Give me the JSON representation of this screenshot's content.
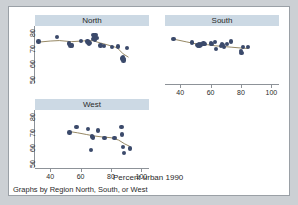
{
  "figure": {
    "x_axis_caption": "Percent urban 1990",
    "note": "Graphs by Region North, South, or West",
    "background": "#ffffff",
    "page_background": "#ccd0d4",
    "border_color": "#9aa0a6"
  },
  "style": {
    "marker_color": "#3b4a6b",
    "trend_color": "#8a7a52",
    "title_bar_color": "#ccd9e4",
    "axis_color": "#8d9298"
  },
  "chart_data": {
    "type": "scatter",
    "title": "",
    "xlabel": "Percent urban 1990",
    "ylabel": "",
    "xlim": [
      30,
      105
    ],
    "ylim": [
      47,
      83
    ],
    "xticks": [
      40,
      60,
      80,
      100
    ],
    "yticks": [
      50,
      60,
      70,
      80
    ],
    "grid": false,
    "legend": "none",
    "note": "Graphs by Region North, South, or West",
    "panels": [
      {
        "name": "North",
        "label": "North",
        "x_axis_shown": false,
        "y_axis_shown": true,
        "xticks": [
          40,
          60,
          80,
          100
        ],
        "yticks": [
          50,
          60,
          70,
          80
        ],
        "points": [
          {
            "x": 32.2,
            "y": 73.1
          },
          {
            "x": 44.6,
            "y": 76.0
          },
          {
            "x": 52.2,
            "y": 71.9
          },
          {
            "x": 53.3,
            "y": 70.6
          },
          {
            "x": 54.3,
            "y": 70.8
          },
          {
            "x": 60.3,
            "y": 73.5
          },
          {
            "x": 64.6,
            "y": 73.2
          },
          {
            "x": 65.2,
            "y": 72.6
          },
          {
            "x": 65.6,
            "y": 71.6
          },
          {
            "x": 66.3,
            "y": 72.4
          },
          {
            "x": 68.0,
            "y": 74.9
          },
          {
            "x": 68.4,
            "y": 77.2
          },
          {
            "x": 68.8,
            "y": 76.0
          },
          {
            "x": 69.3,
            "y": 74.2
          },
          {
            "x": 69.8,
            "y": 77.4
          },
          {
            "x": 70.4,
            "y": 75.6
          },
          {
            "x": 73.0,
            "y": 70.7
          },
          {
            "x": 75.5,
            "y": 70.4
          },
          {
            "x": 80.8,
            "y": 69.9
          },
          {
            "x": 84.5,
            "y": 70.0
          },
          {
            "x": 87.4,
            "y": 62.6
          },
          {
            "x": 87.8,
            "y": 63.6
          },
          {
            "x": 88.2,
            "y": 61.2
          },
          {
            "x": 88.6,
            "y": 62.3
          },
          {
            "x": 90.6,
            "y": 69.2
          }
        ],
        "trend": [
          {
            "x": 32.2,
            "y": 72.8
          },
          {
            "x": 40.0,
            "y": 73.5
          },
          {
            "x": 46.0,
            "y": 73.8
          },
          {
            "x": 54.0,
            "y": 73.1
          },
          {
            "x": 62.0,
            "y": 73.6
          },
          {
            "x": 68.0,
            "y": 73.7
          },
          {
            "x": 73.0,
            "y": 72.3
          },
          {
            "x": 78.0,
            "y": 71.0
          },
          {
            "x": 84.0,
            "y": 69.3
          },
          {
            "x": 88.0,
            "y": 65.4
          },
          {
            "x": 91.5,
            "y": 63.3
          }
        ]
      },
      {
        "name": "South",
        "label": "South",
        "x_axis_shown": true,
        "y_axis_shown": false,
        "xticks": [
          40,
          60,
          80,
          100
        ],
        "yticks": [
          50,
          60,
          70,
          80
        ],
        "points": [
          {
            "x": 35.6,
            "y": 74.9
          },
          {
            "x": 47.6,
            "y": 72.6
          },
          {
            "x": 50.9,
            "y": 71.1
          },
          {
            "x": 51.6,
            "y": 70.7
          },
          {
            "x": 52.2,
            "y": 71.6
          },
          {
            "x": 52.8,
            "y": 70.8
          },
          {
            "x": 53.6,
            "y": 71.2
          },
          {
            "x": 55.4,
            "y": 72.0
          },
          {
            "x": 56.0,
            "y": 71.8
          },
          {
            "x": 60.2,
            "y": 72.0
          },
          {
            "x": 60.8,
            "y": 71.7
          },
          {
            "x": 63.0,
            "y": 72.8
          },
          {
            "x": 63.6,
            "y": 68.4
          },
          {
            "x": 66.8,
            "y": 70.4
          },
          {
            "x": 67.5,
            "y": 71.8
          },
          {
            "x": 68.2,
            "y": 70.9
          },
          {
            "x": 68.8,
            "y": 69.6
          },
          {
            "x": 70.6,
            "y": 71.8
          },
          {
            "x": 73.4,
            "y": 73.3
          },
          {
            "x": 79.8,
            "y": 67.2
          },
          {
            "x": 80.4,
            "y": 66.1
          },
          {
            "x": 81.2,
            "y": 69.6
          },
          {
            "x": 84.7,
            "y": 69.7
          }
        ],
        "trend": [
          {
            "x": 35.6,
            "y": 74.7
          },
          {
            "x": 44.0,
            "y": 73.0
          },
          {
            "x": 52.0,
            "y": 71.4
          },
          {
            "x": 58.0,
            "y": 71.2
          },
          {
            "x": 63.0,
            "y": 70.5
          },
          {
            "x": 68.0,
            "y": 70.1
          },
          {
            "x": 74.0,
            "y": 69.6
          },
          {
            "x": 80.0,
            "y": 69.1
          },
          {
            "x": 84.7,
            "y": 68.8
          }
        ]
      },
      {
        "name": "West",
        "label": "West",
        "x_axis_shown": true,
        "y_axis_shown": true,
        "xticks": [
          40,
          60,
          80,
          100
        ],
        "yticks": [
          50,
          60,
          70,
          80
        ],
        "points": [
          {
            "x": 52.6,
            "y": 68.8
          },
          {
            "x": 57.2,
            "y": 72.3
          },
          {
            "x": 64.8,
            "y": 71.0
          },
          {
            "x": 66.8,
            "y": 57.8
          },
          {
            "x": 67.4,
            "y": 66.2
          },
          {
            "x": 68.2,
            "y": 65.7
          },
          {
            "x": 71.6,
            "y": 70.1
          },
          {
            "x": 75.6,
            "y": 65.3
          },
          {
            "x": 82.2,
            "y": 65.4
          },
          {
            "x": 86.8,
            "y": 72.3
          },
          {
            "x": 87.4,
            "y": 67.6
          },
          {
            "x": 87.8,
            "y": 59.5
          },
          {
            "x": 88.4,
            "y": 55.8
          },
          {
            "x": 92.4,
            "y": 58.6
          }
        ],
        "trend": [
          {
            "x": 52.6,
            "y": 69.4
          },
          {
            "x": 58.0,
            "y": 68.6
          },
          {
            "x": 64.0,
            "y": 67.5
          },
          {
            "x": 69.0,
            "y": 66.6
          },
          {
            "x": 74.0,
            "y": 66.0
          },
          {
            "x": 80.0,
            "y": 65.5
          },
          {
            "x": 85.0,
            "y": 64.0
          },
          {
            "x": 89.0,
            "y": 61.6
          },
          {
            "x": 92.4,
            "y": 60.0
          }
        ]
      }
    ]
  }
}
